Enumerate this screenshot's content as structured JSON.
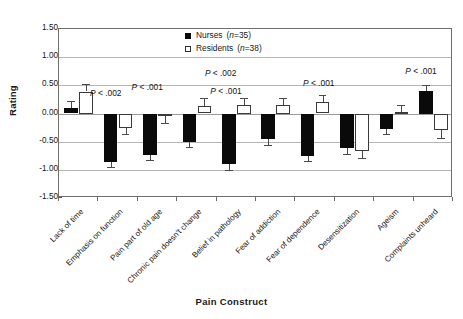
{
  "chart_data": {
    "type": "bar",
    "title": "",
    "xlabel": "Pain Construct",
    "ylabel": "Rating",
    "ylim": [
      -1.5,
      1.5
    ],
    "ytick_labels": [
      "1.50",
      "1.00",
      "0.50",
      "0.00",
      "-0.50",
      "-1.00",
      "-1.50"
    ],
    "ytick_values": [
      1.5,
      1.0,
      0.5,
      0.0,
      -0.5,
      -1.0,
      -1.5
    ],
    "grid": true,
    "legend_position": "top-center",
    "categories": [
      "Lack of time",
      "Emphasis on function",
      "Pain part of old age",
      "Chronic pain doesn't change",
      "Belief in pathology",
      "Fear of addiction",
      "Fear of dependence",
      "Desensitization",
      "Ageism",
      "Complaints unheard"
    ],
    "series": [
      {
        "name": "Nurses",
        "n": 35,
        "color": "#0a0a0a",
        "values": [
          0.1,
          -0.86,
          -0.73,
          -0.51,
          -0.9,
          -0.46,
          -0.75,
          -0.61,
          -0.27,
          0.4
        ],
        "errors": [
          0.13,
          0.09,
          0.09,
          0.08,
          0.1,
          0.1,
          0.09,
          0.11,
          0.1,
          0.11
        ]
      },
      {
        "name": "Residents",
        "n": 38,
        "color": "#ffffff",
        "values": [
          0.39,
          -0.25,
          -0.05,
          0.13,
          0.15,
          0.15,
          0.21,
          -0.66,
          0.02,
          -0.3
        ],
        "errors": [
          0.13,
          0.12,
          0.12,
          0.14,
          0.13,
          0.13,
          0.12,
          0.13,
          0.13,
          0.13
        ]
      }
    ],
    "annotations": [
      {
        "text_prefix": "P",
        "text_rest": " < .002",
        "category_index": 1
      },
      {
        "text_prefix": "P",
        "text_rest": " < .001",
        "category_index": 2
      },
      {
        "text_prefix": "P",
        "text_rest": " < .002",
        "category_index": 3
      },
      {
        "text_prefix": "P",
        "text_rest": " < .001",
        "category_index": 4
      },
      {
        "text_prefix": "P",
        "text_rest": " < .001",
        "category_index": 6
      },
      {
        "text_prefix": "P",
        "text_rest": " < .001",
        "category_index": 9
      }
    ]
  },
  "legend": {
    "items": [
      {
        "label": "Nurses",
        "n_text": "=35",
        "swatch": "filled"
      },
      {
        "label": "Residents",
        "n_text": "=38",
        "swatch": "hollow"
      }
    ]
  },
  "axis": {
    "y_title": "Rating",
    "x_title": "Pain Construct"
  }
}
